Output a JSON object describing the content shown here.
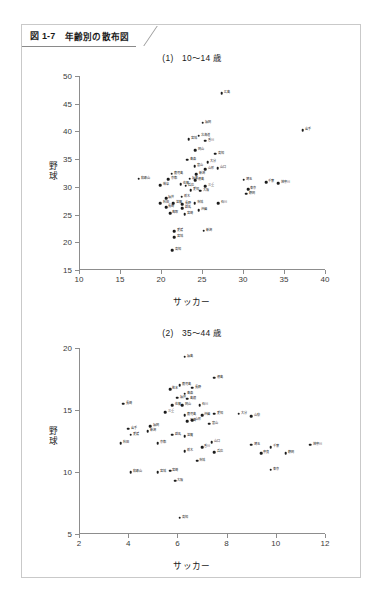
{
  "figure": {
    "number": "図 1-7",
    "title": "年齢別の散布図"
  },
  "charts": [
    {
      "panel_label": "(1)　10〜14 歳",
      "xlabel": "サッカー",
      "ylabel": "野球",
      "xticks": [
        10,
        15,
        20,
        25,
        30,
        35,
        40
      ],
      "yticks": [
        15,
        20,
        25,
        30,
        35,
        40,
        45,
        50
      ],
      "xlim": [
        10,
        40
      ],
      "ylim": [
        15,
        50
      ]
    },
    {
      "panel_label": "(2)　35〜44 歳",
      "xlabel": "サッカー",
      "ylabel": "野球",
      "xticks": [
        2,
        4,
        6,
        8,
        10,
        12
      ],
      "yticks": [
        5,
        10,
        15,
        20
      ],
      "xlim": [
        2,
        12
      ],
      "ylim": [
        5,
        20
      ]
    }
  ],
  "chart_data": [
    {
      "type": "scatter",
      "title": "(1)　10〜14 歳",
      "xlabel": "サッカー",
      "ylabel": "野球",
      "xlim": [
        10,
        40
      ],
      "ylim": [
        15,
        50
      ],
      "xticks": [
        10,
        15,
        20,
        25,
        30,
        35,
        40
      ],
      "yticks": [
        15,
        20,
        25,
        30,
        35,
        40,
        45,
        50
      ],
      "grid": false,
      "legend": "none",
      "point_label_position": "right",
      "points": [
        {
          "label": "広島",
          "x": 27.4,
          "y": 46.9
        },
        {
          "label": "福岡",
          "x": 25.1,
          "y": 41.6
        },
        {
          "label": "岩手",
          "x": 37.3,
          "y": 40.2
        },
        {
          "label": "北海道",
          "x": 24.6,
          "y": 39.2
        },
        {
          "label": "宮城",
          "x": 23.4,
          "y": 38.6
        },
        {
          "label": "香川",
          "x": 25.4,
          "y": 38.3
        },
        {
          "label": "岡山",
          "x": 24.2,
          "y": 36.6
        },
        {
          "label": "高知",
          "x": 26.6,
          "y": 36.0
        },
        {
          "label": "青森",
          "x": 23.2,
          "y": 34.9
        },
        {
          "label": "大分",
          "x": 25.7,
          "y": 34.4
        },
        {
          "label": "富山",
          "x": 24.1,
          "y": 33.7
        },
        {
          "label": "山口",
          "x": 26.9,
          "y": 33.4
        },
        {
          "label": "山形",
          "x": 25.4,
          "y": 33.2
        },
        {
          "label": "鹿児島",
          "x": 21.3,
          "y": 32.4
        },
        {
          "label": "新潟",
          "x": 24.3,
          "y": 32.3
        },
        {
          "label": "和歌山",
          "x": 17.3,
          "y": 31.5
        },
        {
          "label": "京都",
          "x": 20.9,
          "y": 31.4
        },
        {
          "label": "福島",
          "x": 23.5,
          "y": 31.5
        },
        {
          "label": "徳島",
          "x": 24.2,
          "y": 31.2
        },
        {
          "label": "埼玉",
          "x": 30.1,
          "y": 31.3
        },
        {
          "label": "千葉",
          "x": 32.8,
          "y": 30.8
        },
        {
          "label": "神奈川",
          "x": 34.3,
          "y": 30.7
        },
        {
          "label": "岐阜",
          "x": 19.9,
          "y": 30.3
        },
        {
          "label": "佐賀",
          "x": 22.4,
          "y": 30.5
        },
        {
          "label": "兵庫",
          "x": 23.0,
          "y": 30.2
        },
        {
          "label": "三重",
          "x": 25.4,
          "y": 30.1
        },
        {
          "label": "愛知",
          "x": 23.6,
          "y": 29.4
        },
        {
          "label": "大阪",
          "x": 24.8,
          "y": 29.3
        },
        {
          "label": "東京",
          "x": 30.6,
          "y": 29.6
        },
        {
          "label": "静岡",
          "x": 30.4,
          "y": 28.8
        },
        {
          "label": "福井",
          "x": 20.6,
          "y": 28.0
        },
        {
          "label": "栃木",
          "x": 22.5,
          "y": 28.2
        },
        {
          "label": "石川",
          "x": 27.0,
          "y": 27.1
        },
        {
          "label": "秋田",
          "x": 19.9,
          "y": 27.0
        },
        {
          "label": "滋賀",
          "x": 21.5,
          "y": 27.1
        },
        {
          "label": "長野",
          "x": 22.6,
          "y": 26.9
        },
        {
          "label": "茨城",
          "x": 24.1,
          "y": 27.0
        },
        {
          "label": "長崎",
          "x": 20.6,
          "y": 26.3
        },
        {
          "label": "群馬",
          "x": 22.6,
          "y": 26.1
        },
        {
          "label": "沖縄",
          "x": 24.6,
          "y": 25.8
        },
        {
          "label": "鳥取",
          "x": 21.1,
          "y": 25.2
        },
        {
          "label": "宮崎",
          "x": 22.9,
          "y": 25.1
        },
        {
          "label": "愛媛",
          "x": 21.6,
          "y": 22.0
        },
        {
          "label": "新潟",
          "x": 25.2,
          "y": 22.1
        },
        {
          "label": "宮城",
          "x": 21.6,
          "y": 20.9
        },
        {
          "label": "高知",
          "x": 21.4,
          "y": 18.6
        }
      ]
    },
    {
      "type": "scatter",
      "title": "(2)　35〜44 歳",
      "xlabel": "サッカー",
      "ylabel": "野球",
      "xlim": [
        2,
        12
      ],
      "ylim": [
        5,
        20
      ],
      "xticks": [
        2,
        4,
        6,
        8,
        10,
        12
      ],
      "yticks": [
        5,
        10,
        15,
        20
      ],
      "grid": false,
      "legend": "none",
      "point_label_position": "right",
      "points": [
        {
          "label": "福島",
          "x": 6.3,
          "y": 19.3
        },
        {
          "label": "徳島",
          "x": 7.5,
          "y": 17.6
        },
        {
          "label": "鹿児島",
          "x": 6.1,
          "y": 17.0
        },
        {
          "label": "長野",
          "x": 6.6,
          "y": 16.8
        },
        {
          "label": "熊本",
          "x": 5.7,
          "y": 16.7
        },
        {
          "label": "青森",
          "x": 6.3,
          "y": 16.3
        },
        {
          "label": "福井",
          "x": 6.0,
          "y": 16.0
        },
        {
          "label": "島根",
          "x": 6.4,
          "y": 15.9
        },
        {
          "label": "佐賀",
          "x": 5.8,
          "y": 15.4
        },
        {
          "label": "岡山",
          "x": 6.2,
          "y": 15.4
        },
        {
          "label": "石川",
          "x": 6.9,
          "y": 15.4
        },
        {
          "label": "長崎",
          "x": 3.8,
          "y": 15.5
        },
        {
          "label": "三重",
          "x": 5.5,
          "y": 14.8
        },
        {
          "label": "大分",
          "x": 8.5,
          "y": 14.7
        },
        {
          "label": "鹿児島",
          "x": 6.3,
          "y": 14.6
        },
        {
          "label": "沖縄",
          "x": 7.0,
          "y": 14.6
        },
        {
          "label": "愛知",
          "x": 7.5,
          "y": 14.7
        },
        {
          "label": "山形",
          "x": 6.6,
          "y": 14.2
        },
        {
          "label": "広島",
          "x": 6.4,
          "y": 14.1
        },
        {
          "label": "富山",
          "x": 7.3,
          "y": 13.9
        },
        {
          "label": "山梨",
          "x": 9.0,
          "y": 14.5
        },
        {
          "label": "福岡",
          "x": 4.9,
          "y": 13.7
        },
        {
          "label": "岩手",
          "x": 4.0,
          "y": 13.5
        },
        {
          "label": "新潟",
          "x": 4.8,
          "y": 13.3
        },
        {
          "label": "群馬",
          "x": 5.8,
          "y": 13.0
        },
        {
          "label": "滋賀",
          "x": 6.3,
          "y": 12.9
        },
        {
          "label": "愛媛",
          "x": 4.1,
          "y": 13.0
        },
        {
          "label": "秋田",
          "x": 3.7,
          "y": 12.3
        },
        {
          "label": "京都",
          "x": 5.2,
          "y": 12.3
        },
        {
          "label": "山口",
          "x": 7.4,
          "y": 12.4
        },
        {
          "label": "香川",
          "x": 7.0,
          "y": 12.0
        },
        {
          "label": "栃木",
          "x": 6.3,
          "y": 11.7
        },
        {
          "label": "兵庫",
          "x": 7.5,
          "y": 11.6
        },
        {
          "label": "埼玉",
          "x": 9.0,
          "y": 12.2
        },
        {
          "label": "千葉",
          "x": 9.8,
          "y": 12.0
        },
        {
          "label": "神奈川",
          "x": 11.4,
          "y": 12.2
        },
        {
          "label": "奈良",
          "x": 9.4,
          "y": 11.5
        },
        {
          "label": "静岡",
          "x": 10.4,
          "y": 11.5
        },
        {
          "label": "茨城",
          "x": 6.8,
          "y": 10.9
        },
        {
          "label": "和歌山",
          "x": 4.1,
          "y": 10.0
        },
        {
          "label": "宮城",
          "x": 5.2,
          "y": 10.0
        },
        {
          "label": "宮崎",
          "x": 5.7,
          "y": 10.1
        },
        {
          "label": "東京",
          "x": 9.8,
          "y": 10.2
        },
        {
          "label": "大阪",
          "x": 5.9,
          "y": 9.3
        },
        {
          "label": "高知",
          "x": 6.1,
          "y": 6.3
        }
      ]
    }
  ]
}
